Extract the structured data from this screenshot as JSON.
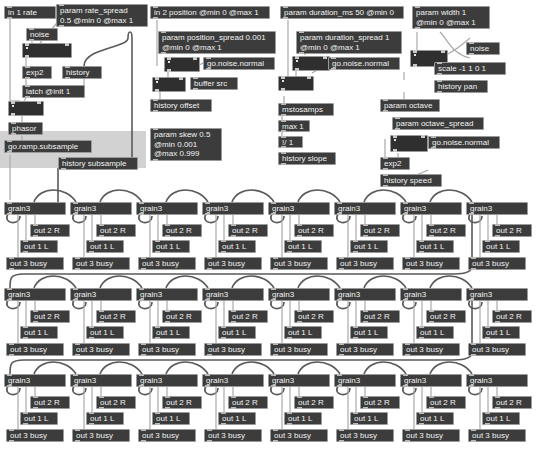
{
  "app": {
    "kind": "gen~ visual patcher canvas",
    "background": "#ffffff",
    "object_fill": "#3c3c3c",
    "object_text": "#f2f2f2",
    "object_border": "#9a9a9a",
    "wire_color": "#5a5a5a",
    "selection_highlight": "#d2d2d2"
  },
  "objects": {
    "in_1_rate": "in 1 rate",
    "param_rate_spread": "param rate_spread\n0.5 @min 0 @max 1",
    "noise_1": "noise",
    "exp2_1": "exp2",
    "history_1": "history",
    "latch_init_1": "latch @init 1",
    "phasor": "phasor",
    "go_ramp_subsample": "go.ramp.subsample",
    "history_subsample": "history subsample",
    "in_2_position": "in 2 position @min 0 @max 1",
    "param_position_spread": "param position_spread 0.001\n@min 0 @max 1",
    "go_noise_normal_1": "go.noise.normal",
    "buffer_src": "buffer src",
    "history_offset": "history offset",
    "param_skew": "param skew 0.5\n@min 0.001\n@max 0.999",
    "param_duration_ms": "param duration_ms 50 @min 0",
    "param_duration_spread": "param duration_spread 1\n@min 0 @max 1",
    "go_noise_normal_2": "go.noise.normal",
    "mstosamps": "mstosamps",
    "max_1": "max 1",
    "inv_div_1": "!/ 1",
    "history_slope": "history slope",
    "param_width": "param width 1\n@min 0 @max 1",
    "noise_2": "noise",
    "scale_box": "scale -1 1 0 1",
    "history_pan": "history pan",
    "param_octave": "param octave",
    "param_octave_spread": "param octave_spread",
    "go_noise_normal_3": "go.noise.normal",
    "exp2_2": "exp2",
    "history_speed": "history speed"
  },
  "grid": {
    "rows": 3,
    "cols": 8,
    "cell": {
      "title": "grain3",
      "out_2": "out 2 R",
      "out_1": "out 1 L",
      "out_3": "out 3 busy"
    }
  }
}
